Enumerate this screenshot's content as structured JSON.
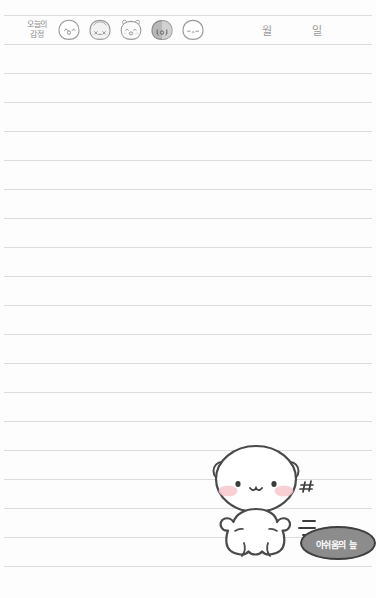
{
  "page": {
    "kind": "handwriting-practice-notebook-page",
    "background_color": "#fdfdfd",
    "rule_color": "#dcdcdc",
    "rule_count": 20,
    "rule_spacing_px": 29,
    "first_rule_y_px": 15
  },
  "header": {
    "mood_label": "오늘의\n감정",
    "mood_faces": [
      {
        "name": "face-happy",
        "expression": "^ o ^",
        "fill": "#ffffff",
        "label": "기쁨"
      },
      {
        "name": "face-sleepy",
        "expression": "x _ x",
        "fill": "#f2f2f2",
        "label": "피곤"
      },
      {
        "name": "face-excited",
        "expression": "^ 0 ^",
        "fill": "#fbfbfb",
        "label": "신남"
      },
      {
        "name": "face-sad",
        "expression": "T o T",
        "fill": "#b8b8b8",
        "label": "슬픔"
      },
      {
        "name": "face-calm",
        "expression": "- . -",
        "fill": "#ffffff",
        "label": "평온"
      }
    ],
    "date": {
      "month_unit": "월",
      "day_unit": "일",
      "month_value": "",
      "day_value": ""
    }
  },
  "illustration": {
    "character": "white-bear",
    "blush_color": "#f6c5ca",
    "outline_color": "#4a4a4a",
    "body_fill": "#ffffff",
    "effects": {
      "sweat_marks": "♯♯",
      "motion_lines": 3
    },
    "speech_bubble": {
      "text": "아쉬움의 늪",
      "fill": "#8c8c8c",
      "text_color": "#ffffff",
      "outline_color": "#3f3f3f"
    }
  },
  "colors": {
    "rule": "#dcdcdc",
    "ink": "#4a4a4a",
    "muted_text": "#9a9a9a",
    "bubble_gray": "#8c8c8c",
    "blush": "#f6c5ca"
  }
}
